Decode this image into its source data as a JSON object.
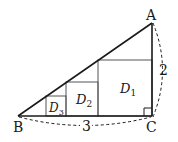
{
  "diagram": {
    "type": "geometry",
    "vertices": {
      "A": {
        "label": "A",
        "x": 152,
        "y": 23
      },
      "B": {
        "label": "B",
        "x": 18,
        "y": 116
      },
      "C": {
        "label": "C",
        "x": 152,
        "y": 116
      }
    },
    "sides": {
      "AC": {
        "label": "2"
      },
      "BC": {
        "label": "3"
      }
    },
    "squares": [
      {
        "name": "D1",
        "letter": "D",
        "sub": "1",
        "x": 98,
        "y": 60,
        "size": 56
      },
      {
        "name": "D2",
        "letter": "D",
        "sub": "2",
        "x": 66,
        "y": 82,
        "size": 34
      },
      {
        "name": "D3",
        "letter": "D",
        "sub": "3",
        "x": 46,
        "y": 96,
        "size": 20
      }
    ],
    "colors": {
      "stroke": "#1a1a1a",
      "square_stroke": "#555555",
      "background": "#ffffff"
    }
  }
}
